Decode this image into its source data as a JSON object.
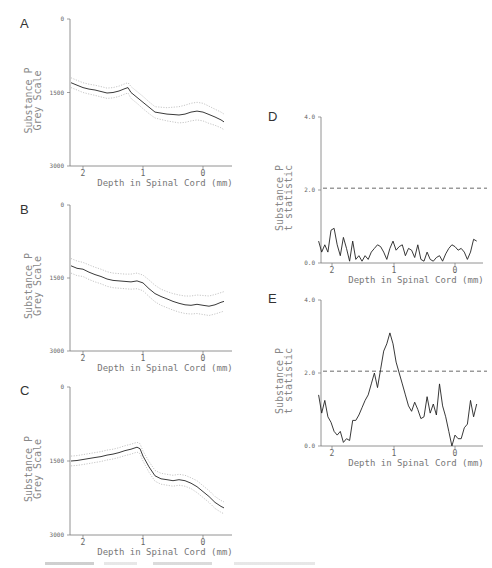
{
  "figure": {
    "caption_visible": "",
    "x_axis_title": "Depth in Spinal Cord (mm)"
  },
  "chart_data": [
    {
      "panel": "A",
      "type": "line",
      "title": "",
      "xlabel": "Depth in Spinal Cord (mm)",
      "ylabel": "Substance P Grey Scale",
      "ylim": [
        0,
        3000
      ],
      "y_inverted": true,
      "yticks": [
        "0",
        "1500",
        "3000"
      ],
      "xlim": [
        2.2,
        -0.35
      ],
      "xticks": [
        "2",
        "1",
        "0"
      ],
      "series": [
        {
          "name": "mean",
          "style": "solid",
          "x": [
            2.2,
            2.1,
            2.0,
            1.9,
            1.8,
            1.7,
            1.6,
            1.5,
            1.4,
            1.3,
            1.25,
            1.2,
            1.1,
            1.0,
            0.9,
            0.8,
            0.7,
            0.6,
            0.5,
            0.4,
            0.3,
            0.2,
            0.1,
            0.0,
            -0.1,
            -0.2,
            -0.3,
            -0.35
          ],
          "values": [
            1300,
            1350,
            1400,
            1430,
            1450,
            1480,
            1510,
            1500,
            1470,
            1420,
            1400,
            1500,
            1600,
            1700,
            1800,
            1900,
            1920,
            1940,
            1950,
            1960,
            1940,
            1900,
            1880,
            1900,
            1950,
            2000,
            2060,
            2100
          ]
        },
        {
          "name": "upper bound",
          "style": "dotted",
          "values": [
            1200,
            1250,
            1300,
            1330,
            1350,
            1380,
            1410,
            1400,
            1370,
            1320,
            1300,
            1380,
            1480,
            1580,
            1690,
            1790,
            1800,
            1810,
            1800,
            1790,
            1760,
            1720,
            1700,
            1720,
            1780,
            1840,
            1900,
            1940
          ]
        },
        {
          "name": "lower bound",
          "style": "dotted",
          "values": [
            1400,
            1450,
            1500,
            1530,
            1560,
            1590,
            1620,
            1610,
            1580,
            1530,
            1510,
            1620,
            1720,
            1830,
            1930,
            2020,
            2050,
            2080,
            2100,
            2120,
            2110,
            2080,
            2060,
            2080,
            2130,
            2170,
            2220,
            2260
          ]
        }
      ]
    },
    {
      "panel": "B",
      "type": "line",
      "xlabel": "Depth in Spinal Cord (mm)",
      "ylabel": "Substance P Grey Scale",
      "ylim": [
        0,
        3000
      ],
      "y_inverted": true,
      "yticks": [
        "0",
        "1500",
        "3000"
      ],
      "xlim": [
        2.2,
        -0.35
      ],
      "xticks": [
        "2",
        "1",
        "0"
      ],
      "series": [
        {
          "name": "mean",
          "style": "solid",
          "x": [
            2.2,
            2.1,
            2.0,
            1.9,
            1.8,
            1.7,
            1.6,
            1.5,
            1.4,
            1.3,
            1.2,
            1.1,
            1.0,
            0.9,
            0.8,
            0.7,
            0.6,
            0.5,
            0.4,
            0.3,
            0.2,
            0.1,
            0.0,
            -0.1,
            -0.2,
            -0.3,
            -0.35
          ],
          "values": [
            1250,
            1300,
            1320,
            1380,
            1430,
            1470,
            1520,
            1550,
            1560,
            1570,
            1580,
            1560,
            1600,
            1720,
            1820,
            1880,
            1930,
            1980,
            2020,
            2050,
            2060,
            2040,
            2060,
            2080,
            2050,
            2000,
            1980
          ],
          "note": "values approximate"
        },
        {
          "name": "upper bound",
          "style": "dotted",
          "values": [
            1100,
            1150,
            1180,
            1230,
            1280,
            1320,
            1370,
            1400,
            1410,
            1420,
            1420,
            1400,
            1440,
            1540,
            1650,
            1730,
            1780,
            1820,
            1850,
            1870,
            1870,
            1850,
            1860,
            1870,
            1840,
            1800,
            1780
          ]
        },
        {
          "name": "lower bound",
          "style": "dotted",
          "values": [
            1400,
            1450,
            1470,
            1530,
            1580,
            1620,
            1670,
            1700,
            1710,
            1720,
            1730,
            1720,
            1760,
            1880,
            1990,
            2060,
            2110,
            2160,
            2200,
            2230,
            2240,
            2230,
            2250,
            2270,
            2240,
            2200,
            2180
          ]
        }
      ]
    },
    {
      "panel": "C",
      "type": "line",
      "xlabel": "Depth in Spinal Cord (mm)",
      "ylabel": "Substance P Grey Scale",
      "ylim": [
        0,
        3000
      ],
      "y_inverted": true,
      "yticks": [
        "0",
        "1500",
        "3000"
      ],
      "xlim": [
        2.2,
        -0.35
      ],
      "xticks": [
        "2",
        "1",
        "0"
      ],
      "series": [
        {
          "name": "mean",
          "style": "solid",
          "x": [
            2.2,
            2.1,
            2.0,
            1.9,
            1.8,
            1.7,
            1.6,
            1.5,
            1.4,
            1.3,
            1.2,
            1.1,
            1.05,
            1.0,
            0.9,
            0.8,
            0.7,
            0.6,
            0.5,
            0.4,
            0.3,
            0.2,
            0.1,
            0.0,
            -0.1,
            -0.2,
            -0.3,
            -0.35
          ],
          "values": [
            1500,
            1490,
            1470,
            1450,
            1430,
            1410,
            1380,
            1360,
            1330,
            1290,
            1260,
            1220,
            1250,
            1400,
            1620,
            1800,
            1860,
            1880,
            1900,
            1880,
            1900,
            1950,
            2020,
            2120,
            2220,
            2340,
            2420,
            2450
          ]
        },
        {
          "name": "upper bound",
          "style": "dotted",
          "values": [
            1400,
            1390,
            1370,
            1350,
            1330,
            1310,
            1280,
            1260,
            1230,
            1190,
            1160,
            1120,
            1150,
            1300,
            1510,
            1690,
            1750,
            1770,
            1790,
            1770,
            1790,
            1840,
            1900,
            2000,
            2100,
            2220,
            2300,
            2330
          ]
        },
        {
          "name": "lower bound",
          "style": "dotted",
          "values": [
            1600,
            1590,
            1570,
            1550,
            1530,
            1510,
            1480,
            1460,
            1430,
            1390,
            1360,
            1320,
            1350,
            1500,
            1730,
            1910,
            1970,
            1990,
            2010,
            1990,
            2010,
            2060,
            2140,
            2240,
            2340,
            2460,
            2540,
            2570
          ]
        }
      ]
    },
    {
      "panel": "D",
      "type": "line",
      "xlabel": "Depth in Spinal Cord (mm)",
      "ylabel": "Substance P t statistic",
      "ylim": [
        0,
        4
      ],
      "yticks": [
        "0.0",
        "2.0",
        "4.0"
      ],
      "xlim": [
        2.2,
        -0.35
      ],
      "xticks": [
        "2",
        "1",
        "0"
      ],
      "threshold": {
        "value": 2.05,
        "style": "dashed"
      },
      "series": [
        {
          "name": "t statistic",
          "style": "solid",
          "x": [
            2.2,
            2.15,
            2.1,
            2.05,
            2.0,
            1.95,
            1.9,
            1.85,
            1.8,
            1.75,
            1.7,
            1.65,
            1.6,
            1.55,
            1.5,
            1.45,
            1.4,
            1.35,
            1.3,
            1.25,
            1.2,
            1.15,
            1.1,
            1.05,
            1.0,
            0.95,
            0.9,
            0.85,
            0.8,
            0.75,
            0.7,
            0.65,
            0.6,
            0.55,
            0.5,
            0.45,
            0.4,
            0.35,
            0.3,
            0.25,
            0.2,
            0.15,
            0.1,
            0.05,
            0.0,
            -0.05,
            -0.1,
            -0.15,
            -0.2,
            -0.25,
            -0.3,
            -0.35
          ],
          "values": [
            0.6,
            0.3,
            0.5,
            0.3,
            0.9,
            0.95,
            0.5,
            0.2,
            0.7,
            0.4,
            0.05,
            0.6,
            0.1,
            0.2,
            0.05,
            0.2,
            0.1,
            0.3,
            0.4,
            0.5,
            0.45,
            0.3,
            0.1,
            0.4,
            0.6,
            0.35,
            0.45,
            0.5,
            0.2,
            0.4,
            0.35,
            0.15,
            0.5,
            0.1,
            0.05,
            0.3,
            0.1,
            0.05,
            0.15,
            0.2,
            0.05,
            0.25,
            0.4,
            0.5,
            0.45,
            0.35,
            0.4,
            0.3,
            0.1,
            0.3,
            0.65,
            0.6
          ]
        }
      ]
    },
    {
      "panel": "E",
      "type": "line",
      "xlabel": "Depth in Spinal Cord (mm)",
      "ylabel": "Substance P t statistic",
      "ylim": [
        0,
        4
      ],
      "yticks": [
        "0.0",
        "2.0",
        "4.0"
      ],
      "xlim": [
        2.2,
        -0.35
      ],
      "xticks": [
        "2",
        "1",
        "0"
      ],
      "threshold": {
        "value": 2.05,
        "style": "dashed"
      },
      "series": [
        {
          "name": "t statistic",
          "style": "solid",
          "x": [
            2.2,
            2.15,
            2.1,
            2.05,
            2.0,
            1.95,
            1.9,
            1.85,
            1.8,
            1.75,
            1.7,
            1.65,
            1.6,
            1.55,
            1.5,
            1.45,
            1.4,
            1.35,
            1.3,
            1.25,
            1.2,
            1.15,
            1.1,
            1.05,
            1.0,
            0.95,
            0.9,
            0.85,
            0.8,
            0.75,
            0.7,
            0.65,
            0.6,
            0.55,
            0.5,
            0.45,
            0.4,
            0.35,
            0.3,
            0.25,
            0.2,
            0.15,
            0.1,
            0.05,
            0.0,
            -0.05,
            -0.1,
            -0.15,
            -0.2,
            -0.25,
            -0.3,
            -0.35
          ],
          "values": [
            1.4,
            0.9,
            1.25,
            0.8,
            0.65,
            0.4,
            0.3,
            0.4,
            0.1,
            0.2,
            0.15,
            0.7,
            0.7,
            0.85,
            1.05,
            1.25,
            1.4,
            1.7,
            2.0,
            1.6,
            2.1,
            2.6,
            2.8,
            3.1,
            2.8,
            2.3,
            2.0,
            1.7,
            1.4,
            1.1,
            0.95,
            1.2,
            1.0,
            0.75,
            0.8,
            1.35,
            0.9,
            1.15,
            0.85,
            1.7,
            1.1,
            0.8,
            0.4,
            0.0,
            0.3,
            0.2,
            0.2,
            0.5,
            0.6,
            1.25,
            0.8,
            1.15
          ]
        }
      ]
    }
  ]
}
